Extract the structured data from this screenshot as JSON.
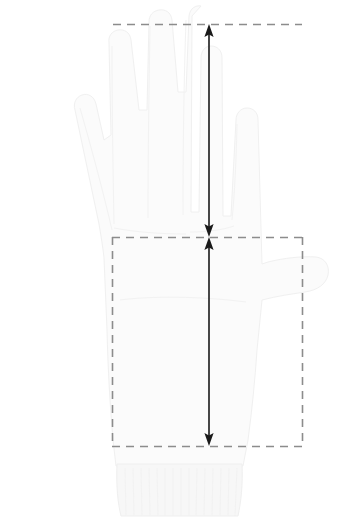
{
  "diagram": {
    "background_color": "#ffffff",
    "width": 345,
    "height": 519
  },
  "colors": {
    "dash_line": "#8c8c8c",
    "arrow": "#1a1a1a",
    "glove_fill": "#fbfbfb",
    "glove_outline": "#f0f0f0",
    "cuff_fill": "#f7f7f7",
    "background": "#ffffff"
  },
  "guides": {
    "top_line": {
      "name": "fingertip-guide-line",
      "y": 24,
      "x_start": 113,
      "x_end": 302,
      "style": "dashed"
    },
    "middle_line": {
      "name": "knuckle-guide-line",
      "y": 237,
      "x_start": 112,
      "x_end": 302,
      "style": "dashed"
    },
    "bottom_line": {
      "name": "wrist-guide-line",
      "y": 446,
      "x_start": 112,
      "x_end": 302,
      "style": "dashed"
    },
    "left_edge": {
      "name": "palm-left-guide-line",
      "x": 112,
      "y_start": 237,
      "y_end": 446,
      "style": "dashed"
    },
    "right_edge": {
      "name": "palm-right-guide-line",
      "x": 302,
      "y_start": 237,
      "y_end": 446,
      "style": "dashed"
    }
  },
  "measurements": [
    {
      "name": "finger-length",
      "label": "",
      "axis": "vertical",
      "x": 209,
      "y_start": 24,
      "y_end": 237,
      "length_px": 213,
      "arrowheads": "both"
    },
    {
      "name": "palm-length",
      "label": "",
      "axis": "vertical",
      "x": 209,
      "y_start": 237,
      "y_end": 446,
      "length_px": 209,
      "arrowheads": "both"
    }
  ],
  "regions": [
    {
      "name": "finger-region",
      "shape": "open-rectangle",
      "x": 113,
      "y": 24,
      "width": 189,
      "height": 213
    },
    {
      "name": "palm-region",
      "shape": "rectangle",
      "x": 112,
      "y": 237,
      "width": 190,
      "height": 209
    }
  ]
}
